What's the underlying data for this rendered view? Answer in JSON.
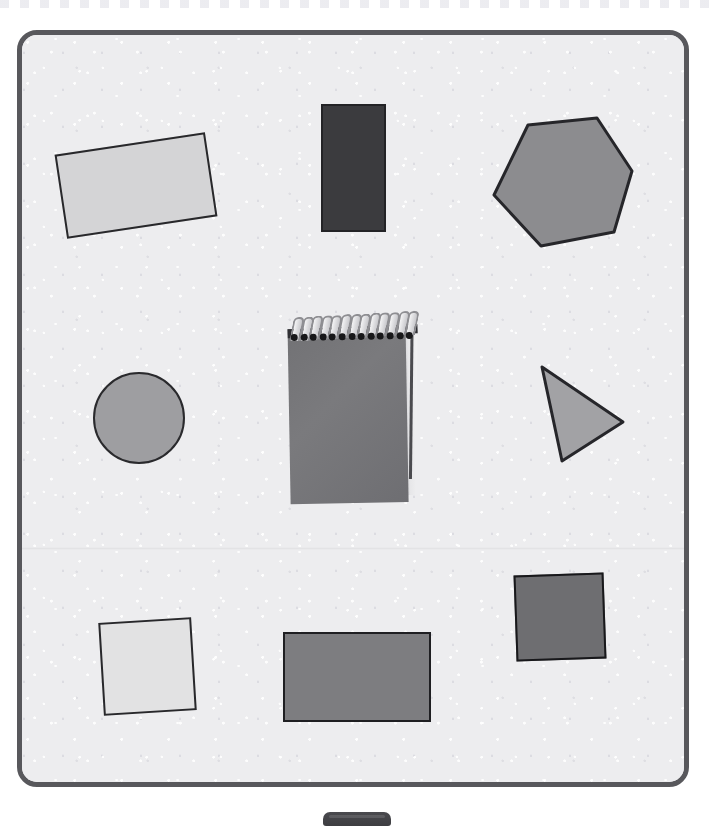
{
  "scene": {
    "title": "Geometric shapes arranged on a speckled board",
    "canvas": {
      "width": 712,
      "height": 832,
      "background_color": "#ffffff"
    },
    "board": {
      "name": "speckled board",
      "fill_color": "#ececee",
      "border_color": "#58585c",
      "corner_radius": 20,
      "has_fold_seam": true
    },
    "top_strip": {
      "pattern": "dashed",
      "color": "#e9e9ee"
    },
    "bottom_tab": {
      "color": "#4a4a4e",
      "shape": "rounded tab"
    }
  },
  "objects": [
    {
      "id": "rect-light",
      "label": "light gray rectangle",
      "shape": "rectangle",
      "fill_color": "#d4d4d6",
      "outline_color": "#28282b",
      "rotation_deg": -8.5,
      "x": 60,
      "y": 143,
      "width": 152,
      "height": 85
    },
    {
      "id": "rect-dark",
      "label": "dark charcoal rectangle",
      "shape": "rectangle",
      "fill_color": "#3b3b3e",
      "outline_color": "#232326",
      "rotation_deg": 0,
      "x": 321,
      "y": 104,
      "width": 65,
      "height": 128
    },
    {
      "id": "hexagon",
      "label": "gray hexagon",
      "shape": "hexagon",
      "fill_color": "#8c8c8f",
      "outline_color": "#26262a",
      "rotation_deg": 0,
      "x": 491,
      "y": 118,
      "width": 142,
      "height": 128
    },
    {
      "id": "circle",
      "label": "gray circle",
      "shape": "circle",
      "fill_color": "#9e9ea1",
      "outline_color": "#2a2a2d",
      "rotation_deg": 0,
      "x": 93,
      "y": 372,
      "width": 92,
      "height": 92
    },
    {
      "id": "notepad",
      "label": "spiral-bound notepad",
      "shape": "notepad",
      "fill_color": "#747477",
      "outline_color": "#2f2f33",
      "spiral_coils": 13,
      "rotation_deg": -1,
      "x": 289,
      "y": 318,
      "width": 132,
      "height": 185
    },
    {
      "id": "triangle",
      "label": "gray triangle pointing right",
      "shape": "triangle",
      "fill_color": "#a2a2a5",
      "outline_color": "#26262a",
      "rotation_deg": 0,
      "x": 538,
      "y": 364,
      "width": 86,
      "height": 98
    },
    {
      "id": "square-light",
      "label": "very light square",
      "shape": "square",
      "fill_color": "#e2e2e3",
      "outline_color": "#28282b",
      "rotation_deg": -3.5,
      "x": 101,
      "y": 620,
      "width": 93,
      "height": 93
    },
    {
      "id": "rect-mid",
      "label": "medium gray rectangle",
      "shape": "rectangle",
      "fill_color": "#7d7d80",
      "outline_color": "#1f1f22",
      "rotation_deg": 0,
      "x": 283,
      "y": 632,
      "width": 148,
      "height": 90
    },
    {
      "id": "square-mid",
      "label": "dark gray square",
      "shape": "square",
      "fill_color": "#6e6e71",
      "outline_color": "#18181b",
      "rotation_deg": -2,
      "x": 515,
      "y": 574,
      "width": 90,
      "height": 86
    }
  ],
  "counts": {
    "total_objects": 9,
    "shape_cutouts": 8,
    "notepads": 1
  }
}
